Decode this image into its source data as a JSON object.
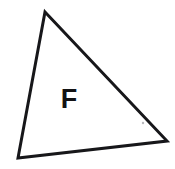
{
  "figure": {
    "background_color": "#ffffff",
    "canvas": {
      "width": 175,
      "height": 169
    },
    "shape": {
      "name": "triangle",
      "kind": "scalene-triangle",
      "stroke_color": "#17171a",
      "stroke_width": 3,
      "fill_color": "#ffffff",
      "points": "45,12 167,141 18,158",
      "vertices": [
        {
          "name": "apex",
          "x": 45,
          "y": 12
        },
        {
          "name": "right",
          "x": 167,
          "y": 141
        },
        {
          "name": "bottom-left",
          "x": 18,
          "y": 158
        }
      ]
    },
    "label": {
      "text": "F",
      "color": "#121214",
      "font_size": 27,
      "x": 69,
      "y": 108
    },
    "artifact": {
      "name": "speck",
      "color": "#b9b9bd",
      "x": 143,
      "y": 123,
      "r": 1.2
    }
  }
}
